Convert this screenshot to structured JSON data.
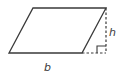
{
  "diagram": {
    "shape": "parallelogram",
    "colors": {
      "stroke": "#3a3a3a",
      "background": "#ffffff"
    },
    "vertices": {
      "top_left": [
        33,
        8
      ],
      "top_right": [
        106,
        8
      ],
      "bottom_right": [
        82,
        53
      ],
      "bottom_left": [
        9,
        53
      ]
    },
    "labels": {
      "base": "b",
      "height": "h"
    },
    "height_line": {
      "style": "dashed",
      "from": [
        106,
        8
      ],
      "to": [
        106,
        53
      ]
    },
    "base_extension": {
      "style": "dashed",
      "from": [
        82,
        53
      ],
      "to": [
        106,
        53
      ]
    },
    "right_angle_marker": true
  }
}
